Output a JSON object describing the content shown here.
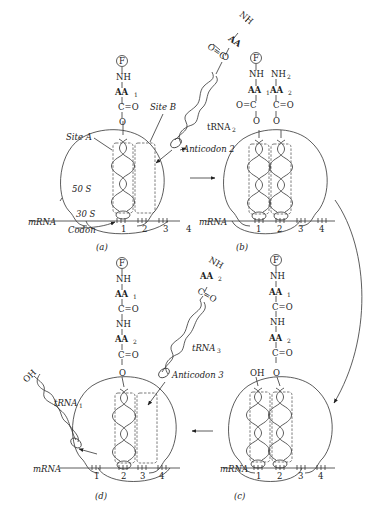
{
  "panels": {
    "a": {
      "label": "(a)"
    },
    "b": {
      "label": "(b)"
    },
    "c": {
      "label": "(c)"
    },
    "d": {
      "label": "(d)"
    }
  },
  "labels": {
    "site_a": "Site A",
    "site_b": "Site B",
    "s50": "50 S",
    "s30": "30 S",
    "codon": "Codon",
    "mrna": "mRNA",
    "trna1": "tRNA",
    "trna1_sub": "1",
    "trna2": "tRNA",
    "trna2_sub": "2",
    "trna3": "tRNA",
    "trna3_sub": "3",
    "anticodon2": "Anticodon 2",
    "anticodon3": "Anticodon 3"
  },
  "chem": {
    "F": "F",
    "NH": "NH",
    "NH2": "NH",
    "NH2_sub": "2",
    "AA": "AA",
    "sub1": "1",
    "sub2": "2",
    "CO_right": "C=O",
    "CO_left": "O=C",
    "C": "C",
    "O": "O",
    "OH": "OH"
  },
  "codon_numbers": [
    "1",
    "2",
    "3",
    "4"
  ]
}
